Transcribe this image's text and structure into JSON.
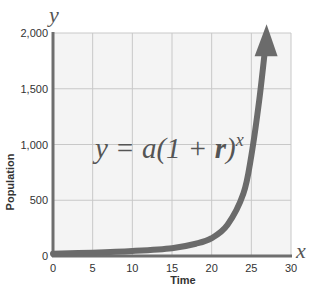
{
  "chart_data": {
    "type": "line",
    "title": "",
    "equation": "y = a(1 + r)^x",
    "equation_parts": {
      "lhs": "y = a(1 + ",
      "r": "r",
      "rparen": ")",
      "exp": "x"
    },
    "xlabel": "Time",
    "ylabel": "Population",
    "x_axis_letter": "x",
    "y_axis_letter": "y",
    "xlim": [
      0,
      30
    ],
    "ylim": [
      0,
      2000
    ],
    "x_ticks": [
      0,
      5,
      10,
      15,
      20,
      25,
      30
    ],
    "y_ticks": [
      0,
      500,
      1000,
      1500,
      2000
    ],
    "x_tick_labels": [
      "0",
      "5",
      "10",
      "15",
      "20",
      "25",
      "30"
    ],
    "y_tick_labels": [
      "0",
      "500",
      "1,000",
      "1,500",
      "2,000"
    ],
    "grid": true,
    "series": [
      {
        "name": "exponential growth",
        "color": "#6b6b6b",
        "arrow_end": true,
        "x": [
          0,
          5,
          10,
          15,
          18,
          20,
          22,
          24,
          25,
          26,
          26.8
        ],
        "values": [
          20,
          30,
          45,
          70,
          110,
          160,
          280,
          560,
          900,
          1400,
          1900
        ]
      }
    ],
    "colors": {
      "axis": "#6e6e6e",
      "grid": "#c8c8c8",
      "plot_bg": "#f4f4f4",
      "curve": "#6b6b6b",
      "text": "#333333"
    }
  }
}
